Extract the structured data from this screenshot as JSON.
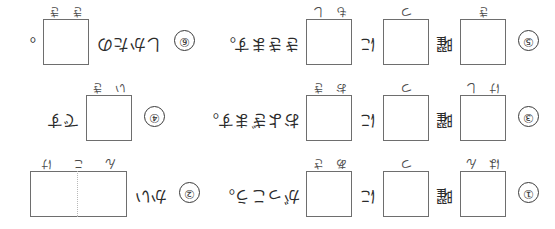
{
  "worksheet": {
    "title": "日本語 かきとり練習シート",
    "orientation_note": "上下逆さま",
    "kanji_prompt": "曜",
    "rows": [
      {
        "number": "①",
        "cells": [
          {
            "type": "square",
            "guides": [
              "は",
              "ん"
            ]
          },
          {
            "type": "square",
            "guides": [
              "つ"
            ]
          },
          {
            "type": "square",
            "guides": [
              "あ",
              "さ"
            ]
          }
        ],
        "kanji": "曜",
        "particle": "に",
        "sentence": "がっこう。"
      },
      {
        "number": "②",
        "cells": [
          {
            "type": "wide",
            "guides": [
              "ん",
              "こ",
              "け"
            ]
          }
        ],
        "kanji": "",
        "particle": "",
        "sentence": "かい"
      },
      {
        "number": "③",
        "cells": [
          {
            "type": "square",
            "guides": [
              "け",
              "し"
            ]
          },
          {
            "type": "square",
            "guides": [
              "つ"
            ]
          },
          {
            "type": "square",
            "guides": [
              "お",
              "き"
            ]
          }
        ],
        "kanji": "曜",
        "particle": "に",
        "sentence": "およぎます。"
      },
      {
        "number": "④",
        "cells": [
          {
            "type": "square",
            "guides": [
              "い",
              "き"
            ]
          }
        ],
        "kanji": "",
        "particle": "",
        "sentence": "です"
      },
      {
        "number": "⑤",
        "cells": [
          {
            "type": "square",
            "guides": [
              "き"
            ]
          },
          {
            "type": "square",
            "guides": [
              "つ"
            ]
          },
          {
            "type": "square",
            "guides": [
              "も",
              "し"
            ]
          }
        ],
        "kanji": "曜",
        "particle": "に",
        "sentence": "ききます。"
      },
      {
        "number": "⑥",
        "cells": [
          {
            "type": "square",
            "guides": [
              "き",
              "き"
            ]
          }
        ],
        "kanji": "",
        "particle": "",
        "sentence": "しかたの"
      }
    ]
  },
  "colors": {
    "paper": "#ffffff",
    "ink": "#2b2b2b",
    "box_line": "#6e6e6e",
    "divider": "#b9b9b9"
  }
}
